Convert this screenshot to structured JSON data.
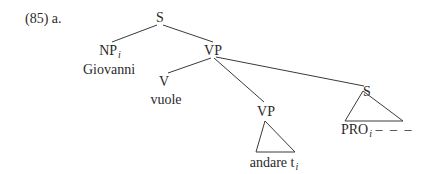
{
  "example": {
    "number": "(85) a."
  },
  "tree": {
    "root": {
      "label": "S"
    },
    "subject": {
      "label": "NP",
      "index": "i",
      "word": "Giovanni"
    },
    "vp": {
      "label": "VP"
    },
    "verb": {
      "label": "V",
      "word": "vuole"
    },
    "vp_embedded": {
      "label": "VP",
      "word": "andare",
      "trace": "t",
      "trace_index": "i"
    },
    "s_embedded": {
      "label": "S",
      "word": "PRO",
      "word_index": "i",
      "continuation": "– – –"
    }
  },
  "colors": {
    "ink": "#2a2a2a",
    "background": "#ffffff"
  }
}
